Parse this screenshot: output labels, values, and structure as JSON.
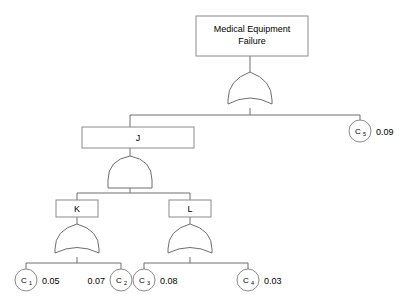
{
  "diagram": {
    "type": "fault-tree",
    "title": "Medical Equipment Failure",
    "top_event": {
      "id": "top",
      "label_line1": "Medical Equipment",
      "label_line2": "Failure",
      "gate": "OR"
    },
    "intermediate_events": [
      {
        "id": "J",
        "label": "J",
        "gate": "AND"
      },
      {
        "id": "K",
        "label": "K",
        "gate": "OR"
      },
      {
        "id": "L",
        "label": "L",
        "gate": "OR"
      }
    ],
    "basic_events": [
      {
        "id": "C1",
        "label": "C",
        "subscript": "1",
        "probability": "0.05",
        "parent": "K"
      },
      {
        "id": "C2",
        "label": "C",
        "subscript": "2",
        "probability": "0.07",
        "parent": "K"
      },
      {
        "id": "C3",
        "label": "C",
        "subscript": "3",
        "probability": "0.08",
        "parent": "L"
      },
      {
        "id": "C4",
        "label": "C",
        "subscript": "4",
        "probability": "0.03",
        "parent": "L"
      },
      {
        "id": "C5",
        "label": "C",
        "subscript": "5",
        "probability": "0.09",
        "parent": "top"
      }
    ],
    "colors": {
      "background": "#ffffff",
      "stroke": "#6e6e6e",
      "box_stroke": "#8a8a8a",
      "text": "#000000"
    }
  }
}
